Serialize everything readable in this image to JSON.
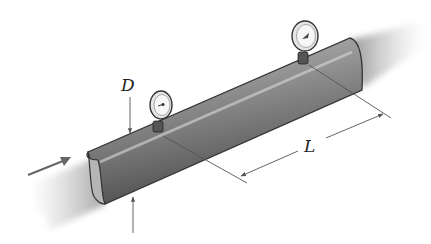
{
  "diagram": {
    "labels": {
      "diameter": "D",
      "length": "L"
    },
    "elements": {
      "flow_arrow": "flow-direction-arrow",
      "gauge_count": 2
    },
    "colors": {
      "pipe_dark": "#4a4a4a",
      "pipe_mid": "#8a8a8a",
      "pipe_light": "#bdbdbd",
      "line": "#555555",
      "background": "#ffffff"
    }
  }
}
